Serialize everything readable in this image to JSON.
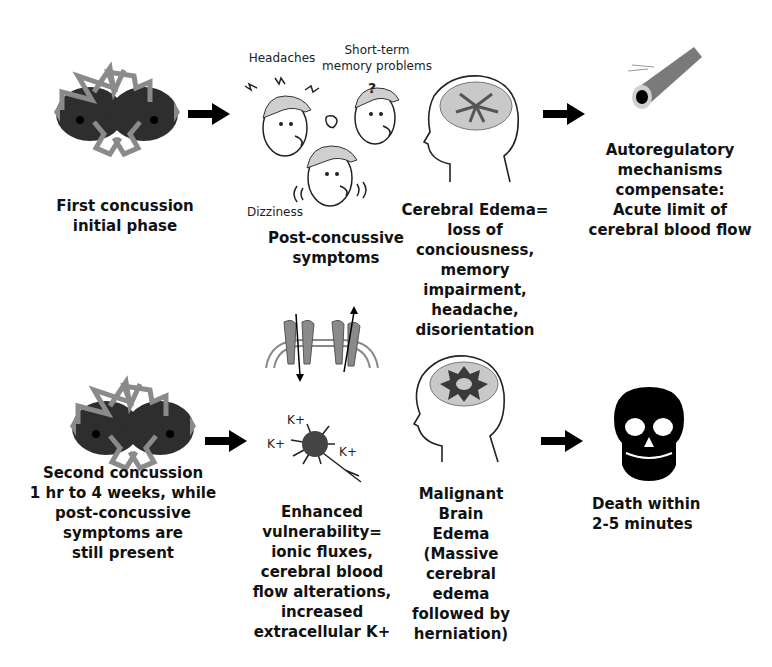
{
  "stages_row1": [
    {
      "id": "first-concussion",
      "label": "First concussion\ninitial phase",
      "icon": "colliding-helmets-icon"
    },
    {
      "id": "post-concussive",
      "label": "Post-concussive\nsymptoms",
      "icon": "dizzy-faces-icon",
      "annotations": {
        "headaches": "Headaches",
        "memory": "Short-term\nmemory problems",
        "dizziness": "Dizziness",
        "question": "?"
      }
    },
    {
      "id": "cerebral-edema",
      "label": "Cerebral Edema=\nloss of\nconciousness,\nmemory\nimpairment,\nheadache,\ndisorientation",
      "icon": "swollen-brain-head-icon"
    },
    {
      "id": "autoregulatory",
      "label": "Autoregulatory\nmechanisms\ncompensate:\nAcute limit of\ncerebral blood flow",
      "icon": "blood-vessel-icon"
    }
  ],
  "stages_row2": [
    {
      "id": "second-concussion",
      "label": "Second concussion\n1 hr to 4 weeks, while\npost-concussive\nsymptoms are\nstill present",
      "icon": "colliding-helmets-icon"
    },
    {
      "id": "enhanced-vulnerability",
      "label": "Enhanced\nvulnerability=\nionic fluxes,\ncerebral blood\nflow alterations,\nincreased\nextracellular K+",
      "icon": "ion-channel-neuron-icon",
      "ions": [
        "K+",
        "K+",
        "K+"
      ]
    },
    {
      "id": "malignant-edema",
      "label": "Malignant Brain\nEdema (Massive\ncerebral edema\nfollowed by\nherniation)",
      "icon": "massive-edema-head-icon"
    },
    {
      "id": "death",
      "label": "Death within\n2-5 minutes",
      "icon": "skull-icon"
    }
  ],
  "colors": {
    "ink": "#111111",
    "gray": "#8a8a8a",
    "dark": "#2e2e2e",
    "brain": "#c9c9c9"
  }
}
